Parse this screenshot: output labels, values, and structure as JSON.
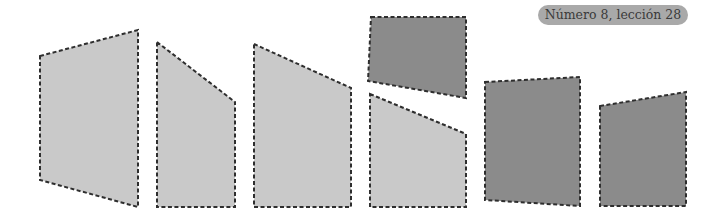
{
  "header": {
    "badge_text": "Número 8, lección 28"
  },
  "colors": {
    "light_fill": "#c9c9c9",
    "dark_fill": "#8b8b8b",
    "outline": "#2e2e2e",
    "badge_bg": "#a9a9a9"
  },
  "shapes": [
    {
      "id": 1,
      "shade": "light",
      "points": "40,56 138,30 138,207 40,180"
    },
    {
      "id": 2,
      "shade": "light",
      "points": "157,42 235,102 235,207 157,207"
    },
    {
      "id": 3,
      "shade": "light",
      "points": "254,44 351,88 351,207 254,207"
    },
    {
      "id": 4,
      "shade": "dark",
      "points": "371,17 466,17 466,98 368,81"
    },
    {
      "id": 5,
      "shade": "light",
      "points": "370,94 466,134 466,207 370,207"
    },
    {
      "id": 6,
      "shade": "dark",
      "points": "485,82 580,77 580,206 485,200"
    },
    {
      "id": 7,
      "shade": "dark",
      "points": "600,106 686,92 686,206 600,206"
    }
  ]
}
